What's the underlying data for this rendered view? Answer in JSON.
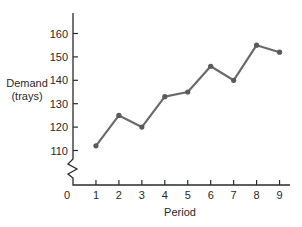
{
  "chart_data": {
    "type": "line",
    "title": "",
    "xlabel": "Period",
    "ylabel_lines": [
      "Demand",
      "(trays)"
    ],
    "x": [
      1,
      2,
      3,
      4,
      5,
      6,
      7,
      8,
      9
    ],
    "series": [
      {
        "name": "Demand",
        "values": [
          112,
          125,
          120,
          133,
          135,
          146,
          140,
          155,
          152
        ]
      }
    ],
    "x_ticks": [
      1,
      2,
      3,
      4,
      5,
      6,
      7,
      8,
      9
    ],
    "x_origin_label": "0",
    "y_ticks": [
      110,
      120,
      130,
      140,
      150,
      160
    ],
    "ylim": [
      110,
      160
    ],
    "y_axis_break": true,
    "grid": false,
    "legend": "none",
    "colors": {
      "line": "#6b6b6b",
      "axis": "#2a2a2a"
    }
  }
}
